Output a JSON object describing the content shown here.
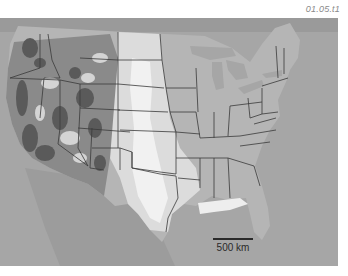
{
  "figure": {
    "id_label": "01.05.t1",
    "scale_bar": {
      "label": "500 km",
      "length_px": 40
    },
    "colors": {
      "ocean_and_foreign": "#a6a6a6",
      "lowland": "#b3b3b3",
      "plains_light": "#dcdcdc",
      "high_plains_white": "#f2f2f2",
      "mountains_dark": "#5e5e5e",
      "state_border": "#3a3a3a",
      "gulf_coast_light": "#eeeeee"
    }
  }
}
